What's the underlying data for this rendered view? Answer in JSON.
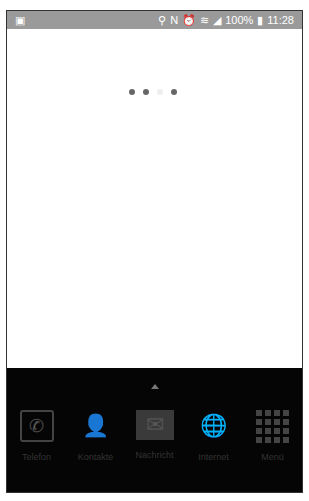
{
  "status_bar": {
    "notification_icon": "screenshot-icon",
    "icons": [
      "location-icon",
      "nfc-icon",
      "alarm-icon",
      "wifi-icon",
      "signal-icon"
    ],
    "battery": "100%",
    "time": "11:28"
  },
  "loader": {
    "dots": 4,
    "faded_index": 2
  },
  "dock": {
    "apps": [
      {
        "label": "Telefon",
        "icon": "phone-icon"
      },
      {
        "label": "Kontakte",
        "icon": "contacts-icon"
      },
      {
        "label": "Nachricht",
        "icon": "message-icon"
      },
      {
        "label": "Internet",
        "icon": "globe-icon"
      },
      {
        "label": "Menü",
        "icon": "apps-grid-icon"
      }
    ]
  }
}
